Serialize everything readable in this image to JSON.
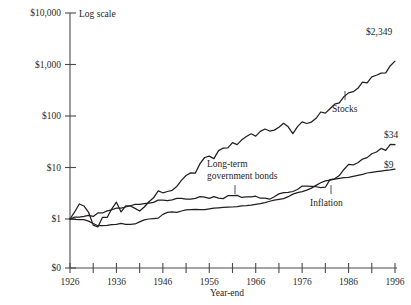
{
  "chart_data": {
    "type": "line",
    "title": "",
    "subtitle": "",
    "scale_note": "Log scale",
    "xlabel": "Year-end",
    "ylabel": "",
    "grid": false,
    "legend_position": "inline-annotations",
    "yscale": "log",
    "ylim": [
      1,
      10000
    ],
    "y_tick_labels": [
      "$10,000",
      "$1,000",
      "$100",
      "$10",
      "$1",
      "$0"
    ],
    "y_tick_values": [
      10000,
      1000,
      100,
      10,
      1,
      0
    ],
    "xlim": [
      1926,
      1996
    ],
    "x_tick_values": [
      1926,
      1931,
      1936,
      1941,
      1946,
      1951,
      1956,
      1961,
      1966,
      1971,
      1976,
      1981,
      1986,
      1991,
      1996
    ],
    "x_tick_labels": [
      "1926",
      "",
      "1936",
      "",
      "1946",
      "",
      "1956",
      "",
      "1966",
      "",
      "1976",
      "",
      "1986",
      "",
      "1996"
    ],
    "x": [
      1926,
      1927,
      1928,
      1929,
      1930,
      1931,
      1932,
      1933,
      1934,
      1935,
      1936,
      1937,
      1938,
      1939,
      1940,
      1941,
      1942,
      1943,
      1944,
      1945,
      1946,
      1947,
      1948,
      1949,
      1950,
      1951,
      1952,
      1953,
      1954,
      1955,
      1956,
      1957,
      1958,
      1959,
      1960,
      1961,
      1962,
      1963,
      1964,
      1965,
      1966,
      1967,
      1968,
      1969,
      1970,
      1971,
      1972,
      1973,
      1974,
      1975,
      1976,
      1977,
      1978,
      1979,
      1980,
      1981,
      1982,
      1983,
      1984,
      1985,
      1986,
      1987,
      1988,
      1989,
      1990,
      1991,
      1992,
      1993,
      1994,
      1995,
      1996
    ],
    "series": [
      {
        "name": "Stocks",
        "end_value_label": "$2,349",
        "end_value": 2349,
        "annotation": "Stocks",
        "values": [
          1.0,
          1.37,
          1.96,
          1.79,
          1.35,
          0.76,
          0.7,
          1.08,
          1.07,
          1.58,
          2.12,
          1.37,
          1.8,
          1.79,
          1.61,
          1.43,
          1.71,
          2.16,
          2.58,
          3.52,
          3.23,
          3.42,
          3.6,
          4.28,
          5.64,
          6.99,
          7.87,
          7.79,
          11.89,
          15.64,
          16.66,
          14.86,
          21.31,
          23.85,
          23.97,
          30.47,
          27.81,
          34.48,
          40.14,
          45.14,
          40.6,
          50.33,
          55.85,
          51.1,
          53.12,
          60.7,
          72.23,
          61.63,
          45.3,
          62.18,
          77.0,
          71.52,
          76.22,
          90.28,
          119.6,
          113.7,
          138.2,
          169.4,
          180.0,
          237.1,
          281.4,
          296.1,
          345.3,
          454.5,
          440.4,
          574.2,
          617.9,
          680.2,
          689.1,
          947.8,
          1165.0
        ]
      },
      {
        "name": "Long-term government bonds",
        "end_value_label": "$34",
        "end_value": 34,
        "annotation": "Long-term government bonds",
        "values": [
          1.0,
          1.09,
          1.09,
          1.13,
          1.18,
          1.12,
          1.31,
          1.31,
          1.44,
          1.51,
          1.62,
          1.62,
          1.71,
          1.81,
          1.92,
          1.93,
          1.99,
          2.04,
          2.1,
          2.33,
          2.33,
          2.27,
          2.35,
          2.51,
          2.51,
          2.42,
          2.44,
          2.52,
          2.71,
          2.67,
          2.52,
          2.71,
          2.55,
          2.49,
          2.83,
          2.85,
          2.88,
          2.62,
          2.69,
          2.68,
          2.77,
          2.53,
          2.55,
          2.42,
          2.71,
          3.07,
          3.24,
          3.28,
          3.42,
          3.74,
          4.36,
          4.33,
          4.28,
          4.23,
          4.06,
          4.14,
          5.8,
          6.02,
          6.96,
          9.16,
          11.48,
          11.2,
          12.36,
          14.6,
          15.55,
          18.52,
          20.0,
          23.5,
          21.55,
          28.0,
          27.8
        ]
      },
      {
        "name": "Inflation",
        "end_value_label": "$9",
        "end_value": 9,
        "annotation": "Inflation",
        "values": [
          1.0,
          0.98,
          0.97,
          0.97,
          0.91,
          0.82,
          0.74,
          0.74,
          0.75,
          0.78,
          0.79,
          0.82,
          0.79,
          0.79,
          0.8,
          0.88,
          0.96,
          1.0,
          1.02,
          1.04,
          1.23,
          1.34,
          1.38,
          1.35,
          1.43,
          1.51,
          1.52,
          1.53,
          1.52,
          1.52,
          1.57,
          1.62,
          1.65,
          1.68,
          1.7,
          1.71,
          1.74,
          1.8,
          1.82,
          1.86,
          1.92,
          1.98,
          2.08,
          2.21,
          2.33,
          2.41,
          2.49,
          2.71,
          3.04,
          3.25,
          3.41,
          3.64,
          3.97,
          4.49,
          5.05,
          5.5,
          5.71,
          5.93,
          6.16,
          6.39,
          6.46,
          6.75,
          7.05,
          7.37,
          7.82,
          8.06,
          8.3,
          8.53,
          8.76,
          9.0,
          9.3
        ]
      }
    ]
  },
  "annotations": {
    "stocks": "Stocks",
    "bonds_line1": "Long-term",
    "bonds_line2": "government bonds",
    "inflation": "Inflation"
  }
}
